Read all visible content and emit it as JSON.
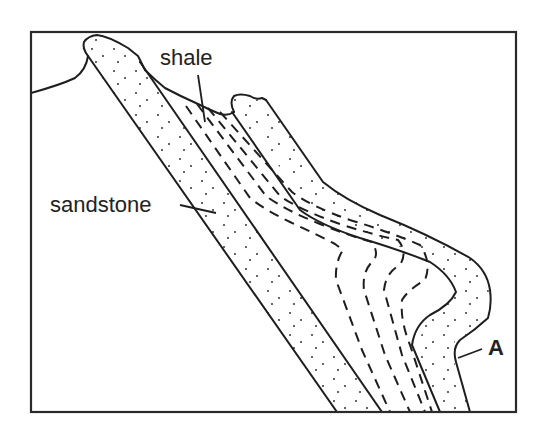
{
  "diagram": {
    "type": "geologic cross-section (fold)",
    "labels": {
      "shale": "shale",
      "sandstone": "sandstone",
      "point_a": "A"
    },
    "layers": [
      {
        "name": "sandstone",
        "pattern": "dotted",
        "position": "left/outer limb"
      },
      {
        "name": "shale",
        "pattern": "dashed lines",
        "position": "middle"
      },
      {
        "name": "sandstone",
        "pattern": "dotted",
        "position": "right/outer limb"
      }
    ],
    "colors": {
      "line": "#1e1e1e",
      "background": "#ffffff"
    }
  }
}
